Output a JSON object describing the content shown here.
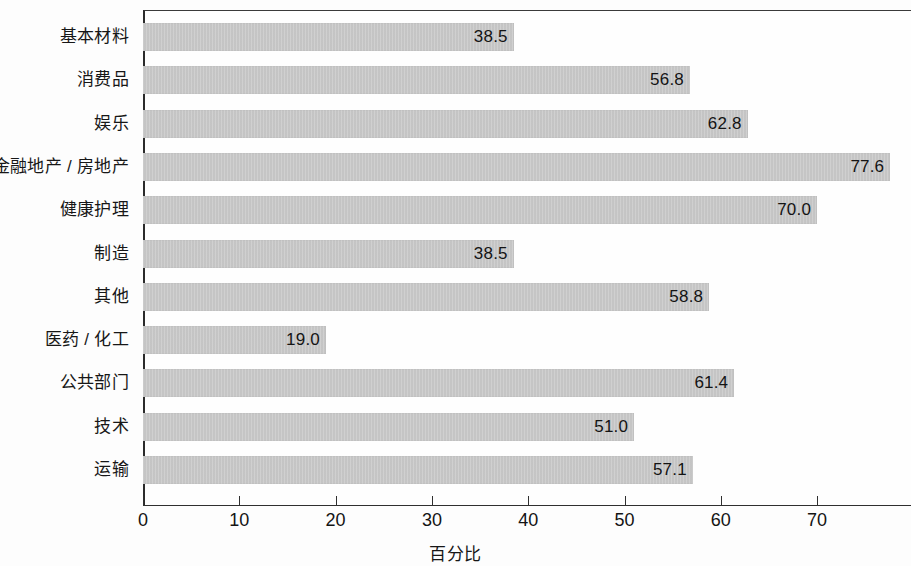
{
  "chart_data": {
    "type": "bar",
    "orientation": "horizontal",
    "title": "",
    "subtitle": "",
    "xlabel": "百分比",
    "ylabel": "",
    "xlim": [
      0,
      79.8
    ],
    "x_ticks": [
      0,
      10,
      20,
      30,
      40,
      50,
      60,
      70
    ],
    "x_tick_labels": [
      "0",
      "10",
      "20",
      "30",
      "40",
      "50",
      "60",
      "70"
    ],
    "grid": false,
    "legend": null,
    "bar_color": "#c8c8c8",
    "value_label_format": "one-decimal",
    "value_label_position": "inside-end",
    "categories": [
      "基本材料",
      "消费品",
      "娱乐",
      "金融地产 / 房地产",
      "健康护理",
      "制造",
      "其他",
      "医药 / 化工",
      "公共部门",
      "技术",
      "运输"
    ],
    "values": [
      38.5,
      56.8,
      62.8,
      77.6,
      70.0,
      38.5,
      58.8,
      19.0,
      61.4,
      51.0,
      57.1
    ],
    "value_labels": [
      "38.5",
      "56.8",
      "62.8",
      "77.6",
      "70.0",
      "38.5",
      "58.8",
      "19.0",
      "61.4",
      "51.0",
      "57.1"
    ]
  }
}
